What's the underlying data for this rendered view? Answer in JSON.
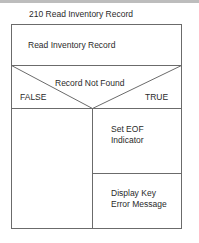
{
  "diagram": {
    "title": "210 Read Inventory Record",
    "process_step": "Read Inventory Record",
    "condition": {
      "label": "Record Not Found",
      "false_label": "FALSE",
      "true_label": "TRUE"
    },
    "true_branch": [
      {
        "line1": "Set EOF",
        "line2": "Indicator"
      },
      {
        "line1": "Display Key",
        "line2": "Error Message"
      }
    ],
    "false_branch": [],
    "line_color": "#6b6b6b"
  }
}
